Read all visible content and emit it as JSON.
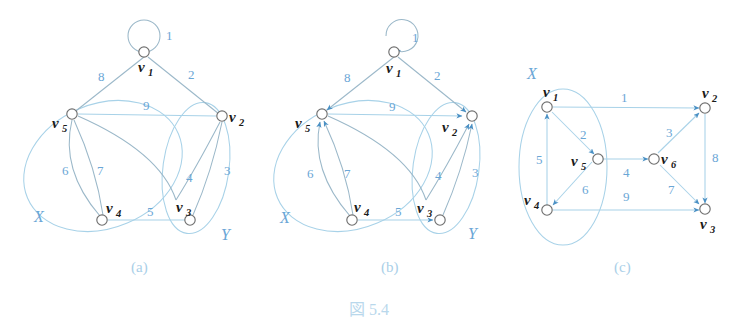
{
  "figure": {
    "caption": "図 5.4",
    "panels": [
      {
        "id": "a",
        "label": "(a)",
        "type": "undirected-bipartite-graph"
      },
      {
        "id": "b",
        "label": "(b)",
        "type": "directed-bipartite-graph"
      },
      {
        "id": "c",
        "label": "(c)",
        "type": "directed-graph"
      }
    ]
  },
  "panel_a": {
    "label": "(a)",
    "set_labels": {
      "x": "X",
      "y": "Y"
    },
    "vertices": [
      {
        "name": "v",
        "sub": "1"
      },
      {
        "name": "v",
        "sub": "2"
      },
      {
        "name": "v",
        "sub": "3"
      },
      {
        "name": "v",
        "sub": "4"
      },
      {
        "name": "v",
        "sub": "5"
      }
    ],
    "edge_labels": [
      "1",
      "2",
      "3",
      "4",
      "5",
      "6",
      "7",
      "8",
      "9"
    ]
  },
  "panel_b": {
    "label": "(b)",
    "set_labels": {
      "x": "X",
      "y": "Y"
    },
    "vertices": [
      {
        "name": "v",
        "sub": "1"
      },
      {
        "name": "v",
        "sub": "2"
      },
      {
        "name": "v",
        "sub": "3"
      },
      {
        "name": "v",
        "sub": "4"
      },
      {
        "name": "v",
        "sub": "5"
      }
    ],
    "edge_labels": [
      "1",
      "2",
      "3",
      "4",
      "5",
      "6",
      "7",
      "8",
      "9"
    ]
  },
  "panel_c": {
    "label": "(c)",
    "set_labels": {
      "x": "X"
    },
    "vertices": [
      {
        "name": "v",
        "sub": "1"
      },
      {
        "name": "v",
        "sub": "2"
      },
      {
        "name": "v",
        "sub": "3"
      },
      {
        "name": "v",
        "sub": "4"
      },
      {
        "name": "v",
        "sub": "5"
      },
      {
        "name": "v",
        "sub": "6"
      }
    ],
    "edge_labels": [
      "1",
      "2",
      "3",
      "4",
      "5",
      "6",
      "7",
      "8",
      "9"
    ]
  },
  "colors": {
    "edge": "#a8d2e8",
    "edge_dark": "#9bb8c9",
    "weight_label": "#6aa6d6",
    "set_label": "#6aa6d6",
    "panel_label": "#a9cfe8",
    "caption": "#b9d8ec",
    "node_stroke": "#6f6f6f",
    "arrow": "#4a90c4"
  }
}
